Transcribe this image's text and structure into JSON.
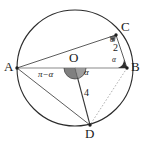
{
  "figure": {
    "type": "circle-geometry-diagram",
    "stroke_color": "#2b2b2b",
    "accent_color": "#6e6e6e",
    "fill_color": "#4a4a4a",
    "background": "#ffffff",
    "circle": {
      "cx": 75,
      "cy": 68,
      "r": 58
    },
    "points": [
      {
        "id": "A",
        "label": "A",
        "x": 17,
        "y": 68,
        "label_x": 4,
        "label_y": 61
      },
      {
        "id": "B",
        "label": "B",
        "x": 127,
        "y": 68,
        "label_x": 131,
        "label_y": 61
      },
      {
        "id": "C",
        "label": "C",
        "x": 116,
        "y": 35,
        "label_x": 121,
        "label_y": 22
      },
      {
        "id": "D",
        "label": "D",
        "x": 90,
        "y": 125,
        "label_x": 86,
        "label_y": 128
      },
      {
        "id": "O",
        "label": "O",
        "x": 75,
        "y": 68,
        "label_x": 70,
        "label_y": 53
      }
    ],
    "segments": [
      {
        "from": "A",
        "to": "B",
        "style": "solid-light"
      },
      {
        "from": "A",
        "to": "C",
        "style": "solid"
      },
      {
        "from": "C",
        "to": "B",
        "style": "solid"
      },
      {
        "from": "A",
        "to": "D",
        "style": "solid"
      },
      {
        "from": "O",
        "to": "D",
        "style": "solid"
      },
      {
        "from": "B",
        "to": "D",
        "style": "dashed"
      }
    ],
    "labels": {
      "alpha_at_c": "α",
      "length_cb": "2",
      "alpha_at_b": "α",
      "pi_minus_alpha": "π−α",
      "alpha_at_o": "α",
      "length_od": "4"
    },
    "label_positions": {
      "alpha_at_c": {
        "x": 110,
        "y": 38
      },
      "length_cb": {
        "x": 114,
        "y": 48
      },
      "alpha_at_b": {
        "x": 113,
        "y": 59
      },
      "pi_minus_alpha": {
        "x": 41,
        "y": 72
      },
      "alpha_at_o": {
        "x": 84,
        "y": 70
      },
      "length_od": {
        "x": 84,
        "y": 93
      }
    }
  }
}
